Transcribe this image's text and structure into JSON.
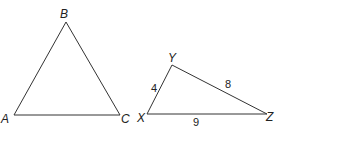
{
  "diagram": {
    "triangle_abc": {
      "vertices": [
        {
          "name": "A",
          "x": 14,
          "y": 115
        },
        {
          "name": "B",
          "x": 66,
          "y": 22
        },
        {
          "name": "C",
          "x": 120,
          "y": 115
        }
      ],
      "labels": {
        "A": "A",
        "B": "B",
        "C": "C"
      }
    },
    "triangle_xyz": {
      "vertices": [
        {
          "name": "X",
          "x": 147,
          "y": 114
        },
        {
          "name": "Y",
          "x": 172,
          "y": 65
        },
        {
          "name": "Z",
          "x": 267,
          "y": 114
        }
      ],
      "labels": {
        "X": "X",
        "Y": "Y",
        "Z": "Z"
      },
      "side_lengths": {
        "XY": "4",
        "YZ": "8",
        "XZ": "9"
      }
    },
    "line_color": "#333333"
  }
}
